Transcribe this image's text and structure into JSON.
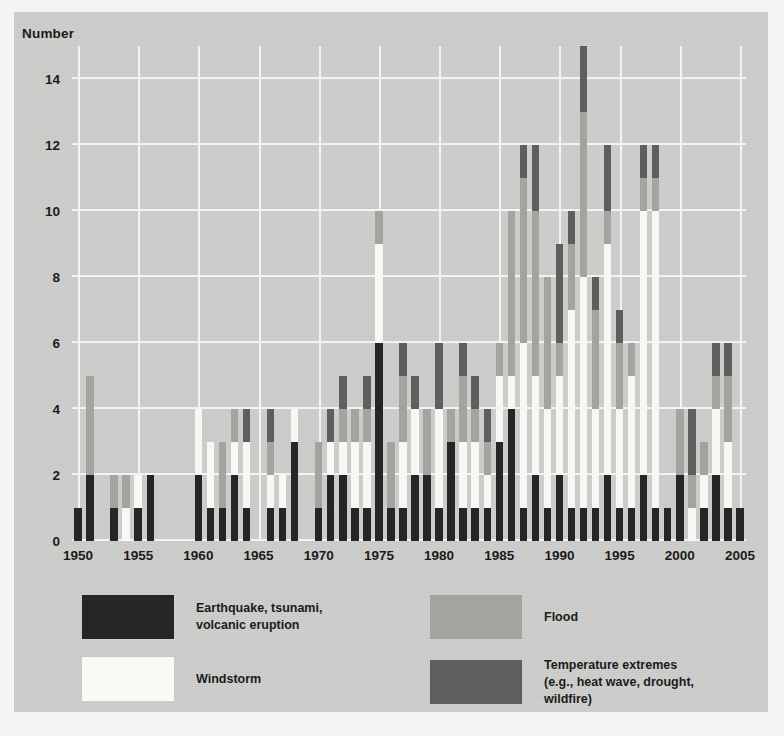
{
  "axes": {
    "y_title": "Number",
    "y_ticks": [
      0,
      2,
      4,
      6,
      8,
      10,
      12,
      14
    ],
    "x_ticks": [
      "1950",
      "1955",
      "1960",
      "1965",
      "1970",
      "1975",
      "1980",
      "1985",
      "1990",
      "1995",
      "2000",
      "2005"
    ]
  },
  "legend": {
    "items": [
      {
        "key": "quake",
        "label": "Earthquake, tsunami,\nvolcanic eruption",
        "color": "#262626"
      },
      {
        "key": "wind",
        "label": "Windstorm",
        "color": "#f9f9f6"
      },
      {
        "key": "flood",
        "label": "Flood",
        "color": "#a3a3a0"
      },
      {
        "key": "temp",
        "label": "Temperature extremes\n(e.g., heat wave, drought, wildfire)",
        "color": "#5e5e5c"
      }
    ]
  },
  "chart_data": {
    "type": "bar",
    "stacked": true,
    "title": "",
    "xlabel": "",
    "ylabel": "Number",
    "ylim": [
      0,
      15
    ],
    "grid": true,
    "legend_position": "below-plot",
    "categories": [
      1950,
      1951,
      1952,
      1953,
      1954,
      1955,
      1956,
      1957,
      1958,
      1959,
      1960,
      1961,
      1962,
      1963,
      1964,
      1965,
      1966,
      1967,
      1968,
      1969,
      1970,
      1971,
      1972,
      1973,
      1974,
      1975,
      1976,
      1977,
      1978,
      1979,
      1980,
      1981,
      1982,
      1983,
      1984,
      1985,
      1986,
      1987,
      1988,
      1989,
      1990,
      1991,
      1992,
      1993,
      1994,
      1995,
      1996,
      1997,
      1998,
      1999,
      2000,
      2001,
      2002,
      2003,
      2004,
      2005
    ],
    "series": [
      {
        "name": "Earthquake, tsunami, volcanic eruption",
        "key": "quake",
        "color": "#262626",
        "values": [
          1,
          2,
          0,
          1,
          0,
          1,
          2,
          0,
          0,
          0,
          2,
          1,
          1,
          2,
          1,
          0,
          1,
          1,
          3,
          0,
          1,
          2,
          2,
          1,
          1,
          6,
          1,
          1,
          2,
          2,
          1,
          3,
          1,
          1,
          1,
          3,
          4,
          1,
          2,
          1,
          2,
          1,
          1,
          1,
          2,
          1,
          1,
          2,
          1,
          1,
          2,
          0,
          1,
          2,
          1,
          1
        ]
      },
      {
        "name": "Windstorm",
        "key": "wind",
        "color": "#f9f9f6",
        "values": [
          0,
          0,
          0,
          0,
          1,
          1,
          0,
          0,
          0,
          0,
          2,
          2,
          0,
          1,
          2,
          0,
          1,
          1,
          1,
          0,
          0,
          1,
          1,
          2,
          2,
          3,
          0,
          2,
          2,
          0,
          3,
          0,
          2,
          2,
          1,
          2,
          1,
          5,
          3,
          3,
          3,
          6,
          7,
          3,
          7,
          3,
          4,
          8,
          9,
          0,
          0,
          1,
          1,
          2,
          2,
          0
        ]
      },
      {
        "name": "Flood",
        "key": "flood",
        "color": "#a3a3a0",
        "values": [
          0,
          3,
          0,
          1,
          1,
          0,
          0,
          0,
          0,
          0,
          0,
          0,
          2,
          1,
          0,
          0,
          1,
          0,
          0,
          0,
          2,
          0,
          1,
          1,
          1,
          1,
          2,
          2,
          0,
          2,
          0,
          1,
          2,
          1,
          1,
          1,
          5,
          5,
          5,
          4,
          1,
          2,
          5,
          3,
          1,
          2,
          1,
          1,
          1,
          0,
          2,
          1,
          1,
          1,
          2,
          0
        ]
      },
      {
        "name": "Temperature extremes (e.g., heat wave, drought, wildfire)",
        "key": "temp",
        "color": "#5e5e5c",
        "values": [
          0,
          0,
          0,
          0,
          0,
          0,
          0,
          0,
          0,
          0,
          0,
          0,
          0,
          0,
          1,
          0,
          1,
          0,
          0,
          0,
          0,
          1,
          1,
          0,
          1,
          0,
          0,
          1,
          1,
          0,
          2,
          0,
          1,
          1,
          1,
          0,
          0,
          1,
          2,
          0,
          3,
          1,
          2,
          1,
          2,
          1,
          0,
          1,
          1,
          0,
          0,
          2,
          0,
          1,
          1,
          0
        ]
      }
    ]
  }
}
